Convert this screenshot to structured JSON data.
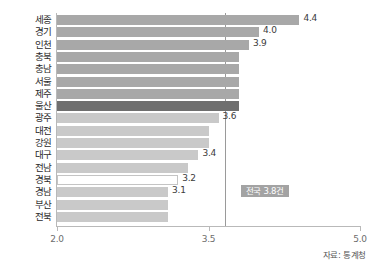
{
  "header": {
    "faint_text": " "
  },
  "source_note": "자료: 통계청",
  "average_badge": "전국 3.8건",
  "axis": {
    "ticks": [
      "2.0",
      "3.5",
      "5.0"
    ]
  },
  "chart_data": {
    "type": "bar",
    "orientation": "horizontal",
    "title": "",
    "subtitle": "",
    "xlabel": "",
    "ylabel": "",
    "xlim": [
      2.0,
      5.0
    ],
    "xticks": [
      2.0,
      3.5,
      5.0
    ],
    "grid": false,
    "legend": null,
    "reference_line": {
      "label": "전국 3.8건",
      "value": 3.8
    },
    "categories": [
      "세종",
      "경기",
      "인천",
      "충북",
      "충남",
      "서울",
      "제주",
      "울산",
      "광주",
      "대전",
      "강원",
      "대구",
      "전남",
      "경북",
      "경남",
      "부산",
      "전북"
    ],
    "values": [
      4.4,
      4.0,
      3.9,
      3.8,
      3.8,
      3.8,
      3.8,
      3.8,
      3.6,
      3.5,
      3.5,
      3.4,
      3.3,
      3.2,
      3.1,
      3.1,
      3.1
    ],
    "labels": [
      "4.4",
      "4.0",
      "3.9",
      "",
      "",
      "",
      "",
      "",
      "3.6",
      "",
      "",
      "3.4",
      "",
      "3.2",
      "3.1",
      "",
      ""
    ],
    "bar_styles": [
      "normal",
      "normal",
      "normal",
      "normal",
      "normal",
      "normal",
      "normal",
      "highlight",
      "light",
      "light",
      "light",
      "light",
      "light",
      "outline",
      "light",
      "light",
      "light"
    ]
  },
  "colors": {
    "bar": "#a8a8a8",
    "bar_highlight": "#6f6f6f",
    "bar_light": "#c9c9c9",
    "badge": "#a3a3a3",
    "axis": "#b9b9b9"
  }
}
